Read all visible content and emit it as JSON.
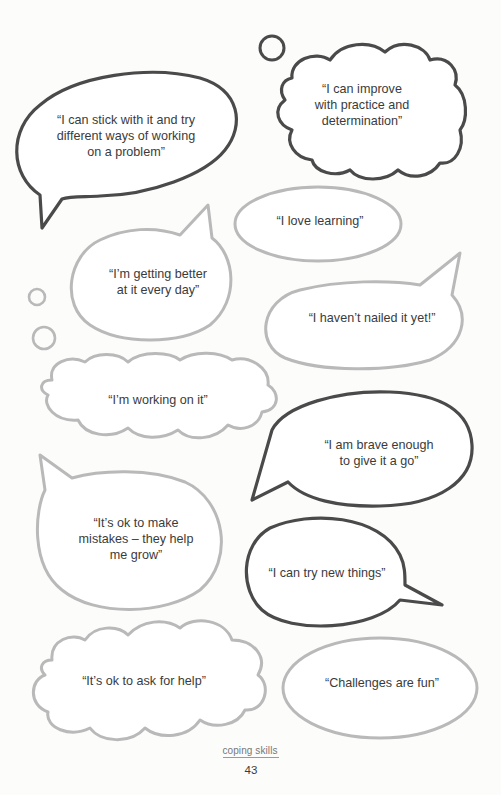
{
  "page": {
    "section_label": "coping skills",
    "page_number": "43"
  },
  "bubbles": [
    {
      "id": "stick-with-it",
      "style": "speech-dark",
      "text": "“I can stick with it and try\ndifferent ways of working\non a problem”"
    },
    {
      "id": "improve-practice",
      "style": "thought-dark",
      "text": "“I can improve\nwith practice and\ndetermination”"
    },
    {
      "id": "love-learning",
      "style": "oval-light",
      "text": "“I love learning”"
    },
    {
      "id": "getting-better",
      "style": "speech-light",
      "text": "“I’m getting better\nat it every day”"
    },
    {
      "id": "havent-nailed",
      "style": "speech-light",
      "text": "“I haven’t nailed it yet!”"
    },
    {
      "id": "working-on-it",
      "style": "thought-light",
      "text": "“I’m working on it”"
    },
    {
      "id": "brave-enough",
      "style": "speech-dark",
      "text": "“I am brave enough\nto give it a go”"
    },
    {
      "id": "ok-mistakes",
      "style": "speech-light",
      "text": "“It’s ok to make\nmistakes – they help\nme grow”"
    },
    {
      "id": "try-new-things",
      "style": "speech-dark",
      "text": "“I can try new things”"
    },
    {
      "id": "ask-for-help",
      "style": "cloud-light",
      "text": "“It’s ok to ask for help”"
    },
    {
      "id": "challenges-fun",
      "style": "oval-light",
      "text": "“Challenges are fun”"
    }
  ],
  "colors": {
    "dark_outline": "#4a4a4a",
    "light_outline": "#b9b9b9",
    "text": "#3b3b3b",
    "background": "#fcfcfb"
  }
}
